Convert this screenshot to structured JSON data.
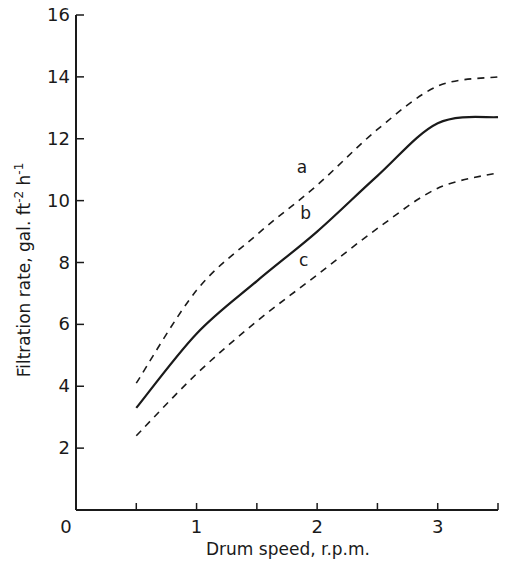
{
  "chart_data": {
    "type": "line",
    "title": "",
    "xlabel": "Drum speed, r.p.m.",
    "ylabel": "Filtration rate, gal. ft⁻² h⁻¹",
    "ylabel_parts": {
      "main": "Filtration rate, gal. ft",
      "sup1": "-2",
      "mid": " h",
      "sup2": "-1"
    },
    "xlim": [
      0,
      3.5
    ],
    "ylim": [
      0,
      16
    ],
    "x_ticks": [
      0.5,
      1,
      1.5,
      2,
      2.5,
      3,
      3.5
    ],
    "x_tick_labels": [
      {
        "v": 0,
        "label": "0"
      },
      {
        "v": 1,
        "label": "1"
      },
      {
        "v": 2,
        "label": "2"
      },
      {
        "v": 3,
        "label": "3"
      }
    ],
    "y_ticks": [
      2,
      4,
      6,
      8,
      10,
      12,
      14,
      16
    ],
    "y_tick_labels": [
      {
        "v": 2,
        "label": "2"
      },
      {
        "v": 4,
        "label": "4"
      },
      {
        "v": 6,
        "label": "6"
      },
      {
        "v": 8,
        "label": "8"
      },
      {
        "v": 10,
        "label": "10"
      },
      {
        "v": 12,
        "label": "12"
      },
      {
        "v": 14,
        "label": "14"
      },
      {
        "v": 16,
        "label": "16"
      }
    ],
    "grid": false,
    "legend": "none (curves labelled inline)",
    "x": [
      0.5,
      1.0,
      1.5,
      2.0,
      2.5,
      3.0,
      3.5
    ],
    "series": [
      {
        "name": "a",
        "style": "dashed",
        "values": [
          4.1,
          7.1,
          8.9,
          10.5,
          12.3,
          13.7,
          14.0
        ],
        "label_pos": {
          "x": 1.83,
          "y": 10.9
        }
      },
      {
        "name": "b",
        "style": "solid",
        "values": [
          3.3,
          5.7,
          7.4,
          9.0,
          10.8,
          12.5,
          12.7
        ],
        "label_pos": {
          "x": 1.86,
          "y": 9.4
        }
      },
      {
        "name": "c",
        "style": "dashed",
        "values": [
          2.4,
          4.4,
          6.1,
          7.6,
          9.1,
          10.4,
          10.9
        ],
        "label_pos": {
          "x": 1.85,
          "y": 7.9
        }
      }
    ]
  }
}
